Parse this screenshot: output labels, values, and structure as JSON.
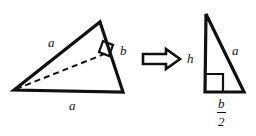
{
  "figure": {
    "background_color": "#ffffff",
    "stroke_color": "#111111",
    "width": 256,
    "height": 136
  },
  "left_triangle": {
    "name": "obtuse triangle with altitude",
    "vertices": [
      {
        "id": "A",
        "x": 14,
        "y": 90
      },
      {
        "id": "B",
        "x": 100,
        "y": 22
      },
      {
        "id": "C",
        "x": 123,
        "y": 92
      }
    ],
    "altitude": {
      "from": {
        "x": 14,
        "y": 90
      },
      "to": {
        "x": 109,
        "y": 52
      },
      "style": "dashed"
    },
    "right_angle_marker": {
      "x": 109,
      "y": 52
    },
    "labels": {
      "side_upper_left": "a",
      "side_bottom": "a",
      "side_right": "b"
    }
  },
  "arrow": {
    "glyph": "right-double-arrow",
    "meaning": "implies / transforms into"
  },
  "right_triangle": {
    "name": "right triangle result",
    "vertices": [
      {
        "id": "P",
        "x": 206,
        "y": 14
      },
      {
        "id": "Q",
        "x": 205,
        "y": 92
      },
      {
        "id": "R",
        "x": 244,
        "y": 92
      }
    ],
    "right_angle_marker": {
      "x": 205,
      "y": 92
    },
    "labels": {
      "leg_vertical": "h",
      "hypotenuse": "a",
      "base_numerator": "b",
      "base_denominator": "2"
    }
  }
}
